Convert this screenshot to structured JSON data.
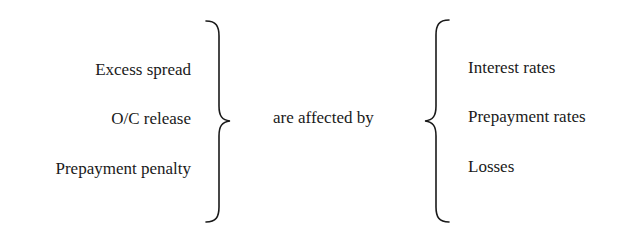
{
  "diagram": {
    "left_group": {
      "items": [
        {
          "label": "Excess spread"
        },
        {
          "label": "O/C release"
        },
        {
          "label": "Prepayment penalty"
        }
      ]
    },
    "connector": {
      "label": "are affected by"
    },
    "right_group": {
      "items": [
        {
          "label": "Interest rates"
        },
        {
          "label": "Prepayment rates"
        },
        {
          "label": "Losses"
        }
      ]
    },
    "braces": {
      "left": {
        "icon": "right-curly-brace-icon",
        "direction": "closing"
      },
      "right": {
        "icon": "left-curly-brace-icon",
        "direction": "opening"
      }
    },
    "colors": {
      "text": "#1a1a1a",
      "background": "#ffffff"
    }
  }
}
